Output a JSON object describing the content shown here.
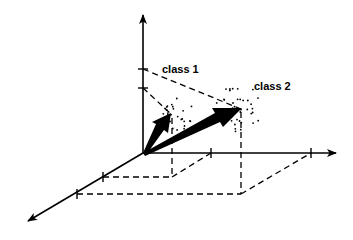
{
  "diagram": {
    "title": "",
    "labels": {
      "class1": "class 1",
      "class2": "class 2"
    },
    "axes": [
      {
        "name": "vertical-axis",
        "ticks": 2
      },
      {
        "name": "horizontal-axis",
        "ticks": 2
      },
      {
        "name": "depth-axis",
        "ticks": 2
      }
    ],
    "vectors": [
      {
        "name": "class-1-vector",
        "label_ref": "class1"
      },
      {
        "name": "class-2-vector",
        "label_ref": "class2"
      }
    ],
    "clusters": [
      {
        "name": "class-1-cluster",
        "point_count": 28
      },
      {
        "name": "class-2-cluster",
        "point_count": 40
      }
    ],
    "colors": {
      "ink": "#000000",
      "background": "#ffffff"
    }
  }
}
